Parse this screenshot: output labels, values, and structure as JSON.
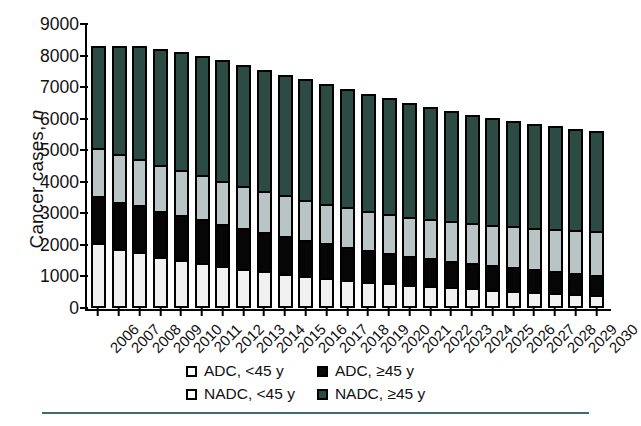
{
  "chart_data": {
    "type": "bar",
    "stacked": true,
    "title": "",
    "subtitle": "",
    "xlabel": "",
    "ylabel": "Cancer cases, n",
    "ylabel_plain": "Cancer cases,",
    "ylabel_italic": "n",
    "ylim": [
      0,
      9000
    ],
    "ytick_step": 1000,
    "yticks": [
      0,
      1000,
      2000,
      3000,
      4000,
      5000,
      6000,
      7000,
      8000,
      9000
    ],
    "ytick_labels": [
      "0",
      "1000",
      "2000",
      "3000",
      "4000",
      "5000",
      "6000",
      "7000",
      "8000",
      "9000"
    ],
    "grid": false,
    "legend_position": "bottom-center",
    "categories": [
      "2006",
      "2007",
      "2008",
      "2009",
      "2010",
      "2011",
      "2012",
      "2013",
      "2014",
      "2015",
      "2016",
      "2017",
      "2018",
      "2019",
      "2020",
      "2021",
      "2022",
      "2023",
      "2024",
      "2025",
      "2026",
      "2027",
      "2028",
      "2029",
      "2030"
    ],
    "series": [
      {
        "name": "ADC, <45 y",
        "key": "adc_lt45",
        "color": "#f1f1f1",
        "order": 0,
        "values": [
          2000,
          1800,
          1700,
          1550,
          1450,
          1350,
          1250,
          1150,
          1080,
          1000,
          930,
          860,
          800,
          740,
          690,
          640,
          600,
          560,
          520,
          480,
          440,
          400,
          370,
          340,
          310
        ]
      },
      {
        "name": "ADC, ≥45 y",
        "key": "adc_ge45",
        "color": "#060606",
        "order": 1,
        "values": [
          1500,
          1500,
          1480,
          1460,
          1420,
          1380,
          1330,
          1290,
          1240,
          1190,
          1140,
          1090,
          1040,
          990,
          940,
          900,
          860,
          820,
          780,
          750,
          720,
          690,
          660,
          630,
          610
        ]
      },
      {
        "name": "NADC, <45 y",
        "key": "nadc_lt45",
        "color": "#b9c5c5",
        "order": 2,
        "values": [
          1500,
          1500,
          1480,
          1450,
          1420,
          1390,
          1360,
          1330,
          1300,
          1280,
          1260,
          1250,
          1240,
          1230,
          1230,
          1230,
          1240,
          1250,
          1270,
          1290,
          1310,
          1330,
          1350,
          1370,
          1390
        ]
      },
      {
        "name": "NADC, ≥45 y",
        "key": "nadc_ge45",
        "color": "#2c4b43",
        "order": 3,
        "values": [
          3300,
          3500,
          3640,
          3740,
          3810,
          3880,
          3910,
          3930,
          3930,
          3930,
          3920,
          3900,
          3870,
          3830,
          3780,
          3720,
          3670,
          3610,
          3560,
          3510,
          3460,
          3420,
          3380,
          3340,
          3310
        ]
      }
    ],
    "totals": [
      8300,
      8300,
      8300,
      8200,
      8100,
      8000,
      7850,
      7700,
      7550,
      7400,
      7250,
      7100,
      6950,
      6790,
      6640,
      6490,
      6370,
      6240,
      6130,
      6030,
      5930,
      5840,
      5760,
      5680,
      5620
    ]
  },
  "legend": {
    "items": [
      {
        "label": "ADC, <45 y",
        "swatch": "sw-adc45m",
        "name": "legend-adc-lt45"
      },
      {
        "label": "ADC, ≥45 y",
        "swatch": "sw-adc45p",
        "name": "legend-adc-ge45"
      },
      {
        "label": "NADC, <45 y",
        "swatch": "sw-nadc45m",
        "name": "legend-nadc-lt45"
      },
      {
        "label": "NADC, ≥45 y",
        "swatch": "sw-nadc45p",
        "name": "legend-nadc-ge45"
      }
    ]
  },
  "colors": {
    "adc_lt45": "#f1f1f1",
    "adc_ge45": "#060606",
    "nadc_lt45": "#b9c5c5",
    "nadc_ge45": "#2c4b43",
    "axis": "#000000",
    "rule": "#3f6a74"
  }
}
